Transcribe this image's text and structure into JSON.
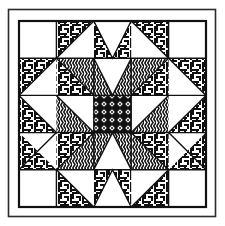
{
  "figure": {
    "kind": "quilt-block-diagram",
    "width": 225,
    "height": 226,
    "background_color": "#ffffff",
    "ink_color": "#111111"
  },
  "frame": {
    "outer_border": {
      "name": "outer-frame",
      "x": 8,
      "y": 9,
      "width": 208,
      "height": 208,
      "stroke_color": "#2b2b2b",
      "stroke_width": 1.6
    },
    "inner_border": {
      "name": "block-border",
      "x": 19,
      "y": 21,
      "width": 187,
      "height": 186,
      "stroke_color": "#111111",
      "stroke_width": 2.2
    }
  },
  "grid": {
    "rows": 5,
    "cols": 5,
    "origin_x": 19,
    "origin_y": 21,
    "cell_width": 37.4,
    "cell_height": 37.2,
    "grid_line_color": "#111111",
    "grid_line_width": 1.4
  },
  "fills": {
    "plain": {
      "name": "plain-white",
      "color": "#ffffff"
    },
    "maze": {
      "name": "maze-weave-pattern",
      "color": "#111111",
      "description": "interlocking basket-weave / greek-key labyrinth texture"
    },
    "zigzag": {
      "name": "vertical-zigzag-pattern",
      "color": "#111111",
      "description": "vertical chevron wave stripes"
    },
    "lattice": {
      "name": "diamond-lattice-pattern",
      "color": "#111111",
      "description": "dense dark diagonal cross-hatch argyle"
    }
  },
  "cells": [
    {
      "row": 0,
      "col": 0,
      "name": "cell-r0c0",
      "shape": "square",
      "fill": "plain"
    },
    {
      "row": 0,
      "col": 1,
      "name": "cell-r0c1",
      "shape": "triangle",
      "corner": "tl",
      "fill": "maze",
      "bg": "plain"
    },
    {
      "row": 0,
      "col": 2,
      "name": "cell-r0c2",
      "shape": "triangle-pair",
      "corner": "tl-tr",
      "fill": "maze",
      "bg": "plain"
    },
    {
      "row": 0,
      "col": 3,
      "name": "cell-r0c3",
      "shape": "triangle",
      "corner": "tr",
      "fill": "maze",
      "bg": "plain"
    },
    {
      "row": 0,
      "col": 4,
      "name": "cell-r0c4",
      "shape": "square",
      "fill": "plain"
    },
    {
      "row": 1,
      "col": 0,
      "name": "cell-r1c0",
      "shape": "triangle",
      "corner": "tl",
      "fill": "maze",
      "bg": "plain"
    },
    {
      "row": 1,
      "col": 1,
      "name": "cell-r1c1",
      "shape": "triangle",
      "corner": "tr",
      "fill": "zigzag",
      "bg": "maze-tri-bl"
    },
    {
      "row": 1,
      "col": 2,
      "name": "cell-r1c2",
      "shape": "triangle-pair",
      "corner": "bl-br",
      "fill": "zigzag",
      "bg": "plain"
    },
    {
      "row": 1,
      "col": 3,
      "name": "cell-r1c3",
      "shape": "triangle",
      "corner": "tl",
      "fill": "zigzag",
      "bg": "maze-tri-br"
    },
    {
      "row": 1,
      "col": 4,
      "name": "cell-r1c4",
      "shape": "triangle",
      "corner": "tr",
      "fill": "maze",
      "bg": "plain"
    },
    {
      "row": 2,
      "col": 0,
      "name": "cell-r2c0",
      "shape": "triangle",
      "corner": "bl",
      "fill": "maze",
      "bg": "plain"
    },
    {
      "row": 2,
      "col": 1,
      "name": "cell-r2c1",
      "shape": "triangle",
      "corner": "br",
      "fill": "zigzag",
      "bg": "plain"
    },
    {
      "row": 2,
      "col": 2,
      "name": "cell-r2c2",
      "shape": "square",
      "fill": "lattice"
    },
    {
      "row": 2,
      "col": 3,
      "name": "cell-r2c3",
      "shape": "triangle",
      "corner": "bl",
      "fill": "zigzag",
      "bg": "plain"
    },
    {
      "row": 2,
      "col": 4,
      "name": "cell-r2c4",
      "shape": "triangle",
      "corner": "br",
      "fill": "maze",
      "bg": "plain"
    },
    {
      "row": 3,
      "col": 0,
      "name": "cell-r3c0",
      "shape": "triangle",
      "corner": "bl",
      "fill": "maze",
      "bg": "plain"
    },
    {
      "row": 3,
      "col": 1,
      "name": "cell-r3c1",
      "shape": "triangle",
      "corner": "br",
      "fill": "zigzag",
      "bg": "maze-tri-tl"
    },
    {
      "row": 3,
      "col": 2,
      "name": "cell-r3c2",
      "shape": "triangle-pair",
      "corner": "tl-tr",
      "fill": "zigzag",
      "bg": "plain"
    },
    {
      "row": 3,
      "col": 3,
      "name": "cell-r3c3",
      "shape": "triangle",
      "corner": "bl",
      "fill": "zigzag",
      "bg": "maze-tri-tr"
    },
    {
      "row": 3,
      "col": 4,
      "name": "cell-r3c4",
      "shape": "triangle",
      "corner": "br",
      "fill": "maze",
      "bg": "plain"
    },
    {
      "row": 4,
      "col": 0,
      "name": "cell-r4c0",
      "shape": "square",
      "fill": "plain"
    },
    {
      "row": 4,
      "col": 1,
      "name": "cell-r4c1",
      "shape": "triangle",
      "corner": "bl",
      "fill": "maze",
      "bg": "plain"
    },
    {
      "row": 4,
      "col": 2,
      "name": "cell-r4c2",
      "shape": "triangle-pair",
      "corner": "bl-br",
      "fill": "maze",
      "bg": "plain"
    },
    {
      "row": 4,
      "col": 3,
      "name": "cell-r4c3",
      "shape": "triangle",
      "corner": "br",
      "fill": "maze",
      "bg": "plain"
    },
    {
      "row": 4,
      "col": 4,
      "name": "cell-r4c4",
      "shape": "square",
      "fill": "plain"
    }
  ]
}
